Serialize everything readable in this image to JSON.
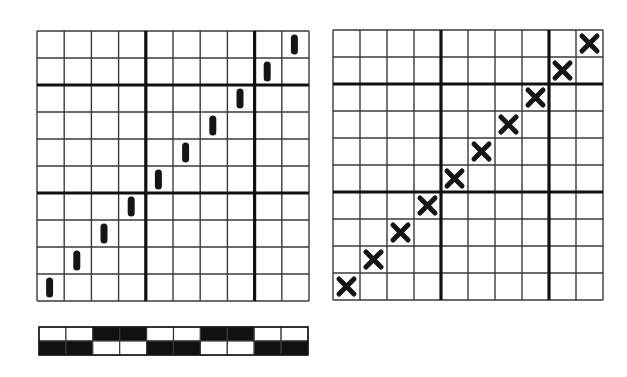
{
  "diagram": {
    "type": "weaving-draft",
    "colors": {
      "background": "#ffffff",
      "thin_line": "#3a3a3a",
      "thick_line": "#111111",
      "mark": "#151515",
      "strip_dark": "#111111",
      "strip_light": "#ffffff"
    },
    "left_grid": {
      "name": "bar-grid",
      "rows": 10,
      "cols": 10,
      "x": 37,
      "y": 31,
      "width": 272,
      "height": 270,
      "thick_cols_after": [
        4,
        8
      ],
      "thick_rows_after": [
        2,
        6
      ],
      "mark_type": "bar",
      "marks": [
        {
          "row": 9,
          "col": 0
        },
        {
          "row": 8,
          "col": 1
        },
        {
          "row": 7,
          "col": 2
        },
        {
          "row": 6,
          "col": 3
        },
        {
          "row": 5,
          "col": 4
        },
        {
          "row": 4,
          "col": 5
        },
        {
          "row": 3,
          "col": 6
        },
        {
          "row": 2,
          "col": 7
        },
        {
          "row": 1,
          "col": 8
        },
        {
          "row": 0,
          "col": 9
        }
      ]
    },
    "right_grid": {
      "name": "cross-grid",
      "rows": 10,
      "cols": 10,
      "x": 333,
      "y": 30,
      "width": 270,
      "height": 270,
      "thick_cols_after": [
        4,
        8
      ],
      "thick_rows_after": [
        2,
        6
      ],
      "mark_type": "cross",
      "marks": [
        {
          "row": 9,
          "col": 0
        },
        {
          "row": 8,
          "col": 1
        },
        {
          "row": 7,
          "col": 2
        },
        {
          "row": 6,
          "col": 3
        },
        {
          "row": 5,
          "col": 4
        },
        {
          "row": 4,
          "col": 5
        },
        {
          "row": 3,
          "col": 6
        },
        {
          "row": 2,
          "col": 7
        },
        {
          "row": 1,
          "col": 8
        },
        {
          "row": 0,
          "col": 9
        }
      ]
    },
    "pattern_strip": {
      "name": "pattern-strip",
      "x": 39,
      "y": 327,
      "width": 269,
      "height": 28,
      "rows": [
        [
          0,
          0,
          1,
          1,
          0,
          0,
          1,
          1,
          0,
          0
        ],
        [
          1,
          1,
          0,
          0,
          1,
          1,
          0,
          0,
          1,
          1
        ]
      ]
    }
  }
}
